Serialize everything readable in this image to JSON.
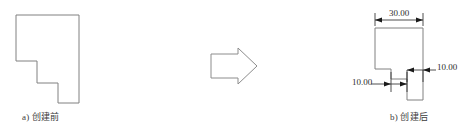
{
  "figure": {
    "background_color": "#ffffff",
    "line_color": "#808080",
    "dimension_color": "#2e2e2e",
    "before": {
      "caption": "a) 创建前",
      "shape_name": "staircase-polygon-before"
    },
    "transition": {
      "icon": "right-arrow-icon"
    },
    "after": {
      "caption": "b) 创建后",
      "shape_name": "staircase-polygon-after",
      "dimensions": [
        {
          "name": "top-width",
          "label": "30.00",
          "orientation": "horizontal"
        },
        {
          "name": "right-offset",
          "label": "10.00",
          "orientation": "horizontal"
        },
        {
          "name": "left-offset",
          "label": "10.00",
          "orientation": "horizontal"
        }
      ]
    }
  }
}
